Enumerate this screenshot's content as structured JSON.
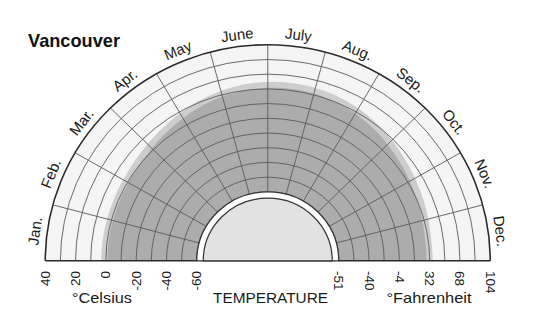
{
  "chart_data": {
    "type": "area",
    "polar": true,
    "title": "Vancouver",
    "categories": [
      "Jan.",
      "Feb.",
      "Mar.",
      "Apr.",
      "May",
      "June",
      "July",
      "Aug.",
      "Sep.",
      "Oct.",
      "Nov.",
      "Dec."
    ],
    "series": [
      {
        "name": "shaded area outer edge (light gray band)",
        "unit": "°C",
        "values": [
          3,
          3,
          4,
          7,
          11,
          14,
          15,
          14,
          11,
          7,
          4,
          2
        ],
        "color": "#cdcdcd"
      },
      {
        "name": "shaded area inner edge (dark gray)",
        "unit": "°C",
        "values": [
          -1,
          -1,
          0,
          3,
          7,
          10,
          11,
          10,
          7,
          3,
          0,
          -2
        ],
        "color": "#acacac"
      }
    ],
    "xlabel": "TEMPERATURE",
    "radial_range_celsius": [
      -60,
      40
    ],
    "grid": true,
    "grid_step_celsius": 10,
    "legend": "none",
    "celsius_axis": {
      "label": "°Celsius",
      "ticks": [
        40,
        20,
        0,
        -20,
        -40,
        -60
      ]
    },
    "fahrenheit_axis": {
      "label": "°Fahrenheit",
      "ticks": [
        -51,
        -40,
        -4,
        32,
        68,
        104
      ],
      "tick_positions_celsius": [
        -60,
        -40,
        -20,
        0,
        20,
        40
      ]
    },
    "colors": {
      "plot_background": "#f5f5f5",
      "grid_line": "#5a5a5a",
      "outer_arc": "#2a2a2a",
      "center_ring": "#ffffff",
      "center_disc": "#e2e2e2"
    }
  }
}
